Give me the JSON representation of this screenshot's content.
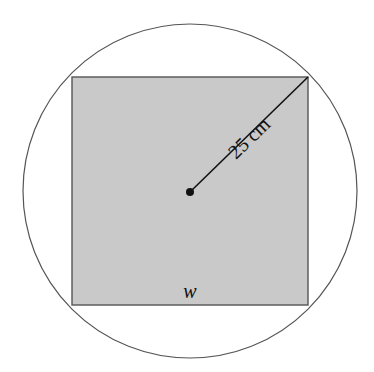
{
  "diagram": {
    "type": "square-inscribed-in-circle",
    "radius_label": "25 cm",
    "side_label": "w",
    "colors": {
      "square_fill": "#c9c9c9",
      "stroke": "#555555",
      "background": "#ffffff"
    }
  }
}
